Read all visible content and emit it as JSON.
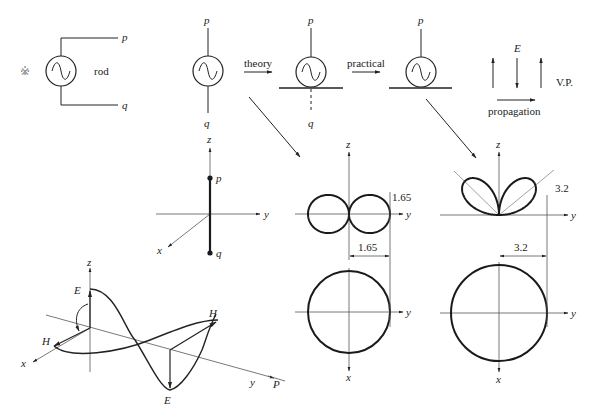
{
  "colors": {
    "ink": "#1a1a1a",
    "axis": "#555555",
    "background": "#ffffff"
  },
  "symbols": {
    "reference_mark": "※"
  },
  "rod_source": {
    "label": "rod",
    "terminal_top": "p",
    "terminal_bottom": "q"
  },
  "dipole_source": {
    "terminal_top": "p",
    "terminal_bottom": "q"
  },
  "transition_1": {
    "label": "theory"
  },
  "ground_image_source": {
    "terminal_top": "p",
    "terminal_bottom_image": "q"
  },
  "transition_2": {
    "label": "practical"
  },
  "grounded_source": {
    "terminal_top": "p"
  },
  "wave_polarization": {
    "field_label": "E",
    "polarization_label": "V.P.",
    "direction_label": "propagation"
  },
  "dipole_axes": {
    "z": "z",
    "y": "y",
    "x": "x",
    "top_point": "p",
    "bottom_point": "q"
  },
  "pattern_theory": {
    "vertical": {
      "z_axis": "z",
      "y_axis": "y",
      "height_value": "1.65"
    },
    "horizontal": {
      "y_axis": "y",
      "x_axis": "x",
      "width_value": "1.65"
    }
  },
  "pattern_practical": {
    "vertical": {
      "z_axis": "z",
      "y_axis": "y",
      "lobe_value": "3.2"
    },
    "horizontal": {
      "y_axis": "y",
      "x_axis": "x",
      "width_value": "3.2"
    }
  },
  "em_wave": {
    "z_axis": "z",
    "x_axis": "x",
    "y_axis": "y",
    "e_field_top": "E",
    "e_field_bottom": "E",
    "h_field_left": "H",
    "h_field_right": "H",
    "propagation": "P"
  }
}
